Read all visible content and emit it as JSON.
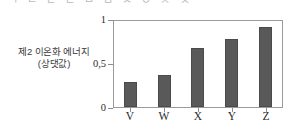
{
  "figure": {
    "top_clipped_text": "ㄱ ㄴ ㄷ ㄹ ㅁ ㅂ ㅅ ㅇ ㅈ ㅊ",
    "y_axis_title_line1": "제2 이온화 에너지",
    "y_axis_title_line2": "(상댓값)",
    "bar_color": "#595959",
    "frame_color": "#9a9a9a"
  },
  "chart_data": {
    "type": "bar",
    "title": "",
    "xlabel": "",
    "ylabel": "제2 이온화 에너지 (상댓값)",
    "categories": [
      "V",
      "W",
      "X",
      "Y",
      "Z"
    ],
    "values": [
      0.32,
      0.4,
      0.74,
      0.86,
      1.0
    ],
    "ylim": [
      0,
      1.08
    ],
    "ytick_values": [
      0,
      0.5,
      1
    ],
    "ytick_labels": [
      "0",
      "0,5",
      "1"
    ],
    "grid": false,
    "legend": "none"
  }
}
